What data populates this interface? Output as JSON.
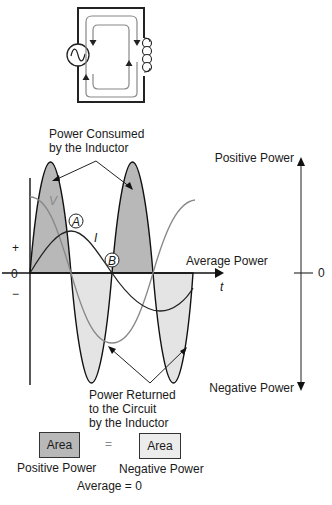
{
  "circuit": {
    "components": [
      "ac-source",
      "inductor"
    ],
    "current_flow_arrows": "clockwise and counter-clockwise loops"
  },
  "labels": {
    "power_consumed_line1": "Power Consumed",
    "power_consumed_line2": "by the Inductor",
    "power_returned_line1": "Power Returned",
    "power_returned_line2": "to the Circuit",
    "power_returned_line3": "by the Inductor",
    "voltage": "V",
    "current": "I",
    "point_a": "A",
    "point_b": "B",
    "plus": "+",
    "zero": "0",
    "minus": "−",
    "average_power": "Average Power",
    "time": "t",
    "positive_power": "Positive Power",
    "negative_power": "Negative Power",
    "scale_zero": "0"
  },
  "legend": {
    "area_left": "Area",
    "equals": "=",
    "area_right": "Area",
    "positive_caption": "Positive Power",
    "negative_caption": "Negative Power",
    "average": "Average = 0"
  },
  "colors": {
    "positive_fill": "#b8b8b8",
    "negative_fill": "#e4e4e4",
    "circuit_wire": "#222222",
    "flow_arrow": "#777777",
    "voltage_curve": "#888888",
    "current_curve": "#222222"
  }
}
